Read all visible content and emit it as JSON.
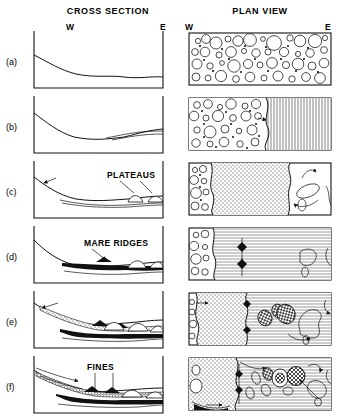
{
  "figure": {
    "type": "geologic-evolution-panel-diagram",
    "headers": {
      "cross_section": "CROSS SECTION",
      "plan_view": "PLAN VIEW"
    },
    "compass": {
      "west": "W",
      "east": "E"
    },
    "panels": [
      {
        "id": "a",
        "label": "(a)",
        "cross_section": {
          "description": "Smooth concave basin floor sloping from west rim to flat east floor",
          "annotations": []
        },
        "plan_view": {
          "description": "Uniform field of scattered circular craters of many sizes across entire basin",
          "texture": "craters",
          "annotations": []
        }
      },
      {
        "id": "b",
        "label": "(b)",
        "cross_section": {
          "description": "Basin floor with thin lava layer beginning to pond on eastern half",
          "annotations": []
        },
        "plan_view": {
          "description": "Craters on west, vertically lineated mare fill encroaching from east",
          "texture": "craters-and-vertical-lines",
          "annotations": []
        }
      },
      {
        "id": "c",
        "label": "(c)",
        "cross_section": {
          "description": "Lava layer thickens, dome-shaped plateaus rise on eastern floor",
          "annotations": [
            "PLATEAUS"
          ]
        },
        "plan_view": {
          "description": "Craters west, stippled unit center, flow lobes with arrows east",
          "texture": "craters-stipple-flowlines",
          "annotations": []
        }
      },
      {
        "id": "d",
        "label": "(d)",
        "cross_section": {
          "description": "Dark mare fill with raised ridges along the basin floor",
          "annotations": [
            "MARE RIDGES"
          ]
        },
        "plan_view": {
          "description": "Horizontally lineated mare with diamond ridge symbols and lobate outlines",
          "texture": "horizontal-lines-with-ridges",
          "annotations": []
        }
      },
      {
        "id": "e",
        "label": "(e)",
        "cross_section": {
          "description": "Stippled debris wedge over dark mare, multiple domes and ridges",
          "annotations": []
        },
        "plan_view": {
          "description": "Stippled west unit, ridge line, cross-hatched blobs and flow lobes east",
          "texture": "stipple-hatched-blobs",
          "annotations": []
        }
      },
      {
        "id": "f",
        "label": "(f)",
        "cross_section": {
          "description": "Fine-grained dark deposits infill the floor, arrows show transport west to east",
          "annotations": [
            "FINES"
          ]
        },
        "plan_view": {
          "description": "Large stippled unit west, numerous hatched and outlined lobes east with arrows",
          "texture": "stipple-hatched-lobes-arrows",
          "annotations": []
        }
      }
    ],
    "annotation_labels": {
      "plateaus": "PLATEAUS",
      "mare_ridges": "MARE RIDGES",
      "fines": "FINES"
    },
    "colors": {
      "ink": "#111111",
      "background": "#ffffff"
    }
  }
}
